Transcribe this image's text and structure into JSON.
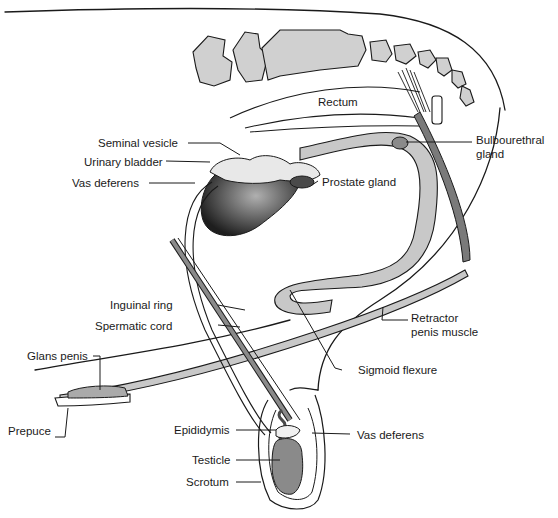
{
  "diagram": {
    "colors": {
      "outline": "#1a1a1a",
      "tissue_gray": "#c8c8c8",
      "dark_gray": "#7a7a7a",
      "bladder_dark": "#2a2a2a",
      "background": "#ffffff"
    },
    "labels": {
      "rectum": "Rectum",
      "seminal_vesicle": "Seminal vesicle",
      "urinary_bladder": "Urinary bladder",
      "vas_deferens_upper": "Vas deferens",
      "prostate_gland": "Prostate gland",
      "bulbourethral_line1": "Bulbourethral",
      "bulbourethral_line2": "gland",
      "inguinal_ring": "Inguinal ring",
      "spermatic_cord": "Spermatic cord",
      "retractor_line1": "Retractor",
      "retractor_line2": "penis muscle",
      "glans_penis": "Glans penis",
      "sigmoid_flexure": "Sigmoid flexure",
      "prepuce": "Prepuce",
      "epididymis": "Epididymis",
      "vas_deferens_lower": "Vas deferens",
      "testicle": "Testicle",
      "scrotum": "Scrotum"
    }
  }
}
